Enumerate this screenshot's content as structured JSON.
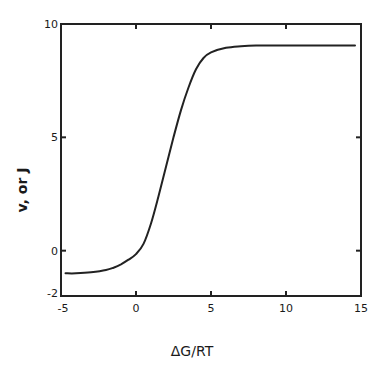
{
  "chart_data": {
    "type": "line",
    "title": "",
    "xlabel": "ΔG/RT",
    "ylabel": "v, or J",
    "xlim": [
      -5,
      15
    ],
    "ylim": [
      -2,
      10
    ],
    "xticks": [
      -5,
      0,
      5,
      10,
      15
    ],
    "xtick_labels": [
      "-5",
      "0",
      "5",
      "10",
      "15"
    ],
    "yticks": [
      -2,
      0,
      5,
      10
    ],
    "ytick_labels": [
      "-2",
      "0",
      "5",
      "10"
    ],
    "grid": false,
    "legend": null,
    "series": [
      {
        "name": "v, or J",
        "x": [
          -4.7,
          -4,
          -3,
          -2,
          -1.5,
          -1,
          -0.5,
          0,
          0.5,
          1,
          1.5,
          2,
          2.5,
          3,
          3.5,
          4,
          4.5,
          5,
          6,
          7,
          8,
          10,
          12,
          14.6
        ],
        "y": [
          -1.0,
          -1.0,
          -0.95,
          -0.85,
          -0.75,
          -0.6,
          -0.4,
          -0.15,
          0.3,
          1.2,
          2.4,
          3.7,
          5.0,
          6.2,
          7.2,
          8.0,
          8.5,
          8.75,
          8.95,
          9.02,
          9.05,
          9.05,
          9.05,
          9.05
        ]
      }
    ]
  }
}
